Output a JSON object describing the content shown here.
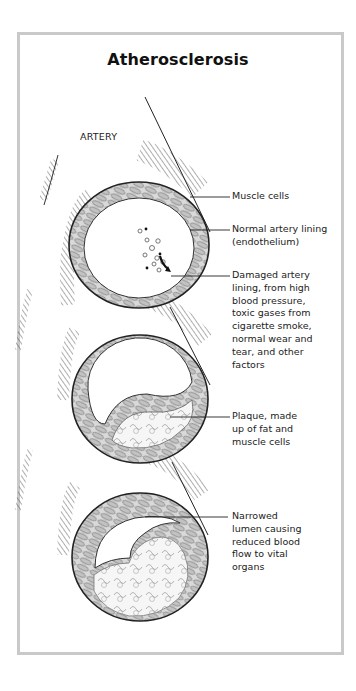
{
  "title": "Atherosclerosis",
  "artery_label": "ARTERY",
  "callouts": [
    {
      "id": "muscle-cells",
      "text": "Muscle cells"
    },
    {
      "id": "normal-lining",
      "text": "Normal artery lining\n(endothelium)"
    },
    {
      "id": "damaged-lining",
      "text": "Damaged artery\nlining, from high\nblood pressure,\ntoxic gases from\ncigarette smoke,\nnormal wear and\ntear, and other\nfactors"
    },
    {
      "id": "plaque",
      "text": "Plaque, made\nup of fat and\nmuscle cells"
    },
    {
      "id": "narrowed-lumen",
      "text": "Narrowed\nlumen causing\nreduced blood\nflow to vital\norgans"
    }
  ],
  "stages": [
    {
      "id": "healthy-artery",
      "description": "Cross-section of artery with normal lining and early damage"
    },
    {
      "id": "plaque-forming",
      "description": "Cross-section of artery with plaque deposit"
    },
    {
      "id": "narrowed-artery",
      "description": "Cross-section of artery with narrowed lumen"
    }
  ],
  "colors": {
    "frame_border": "#c9c9c9",
    "outline": "#222222",
    "wall_fill": "#d8d8d8",
    "cell_fill": "#bdbdbd",
    "plaque_fill": "#f4f4f4"
  }
}
